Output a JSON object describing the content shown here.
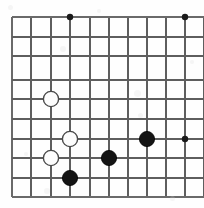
{
  "figure": {
    "kind": "go-board-diagram",
    "width_px": 204,
    "height_px": 208,
    "background_color": "#fefefe"
  },
  "board": {
    "line_color": "#5e5e5e",
    "edge_line_color": "#6a6a6a",
    "grid_spacing_px": 19.4,
    "vertical_lines_x": [
      12,
      31,
      51,
      70,
      90,
      109,
      128,
      147,
      166,
      185,
      204
    ],
    "horizontal_lines_y": [
      17,
      37,
      56,
      80,
      99,
      119,
      139,
      158,
      178,
      197
    ],
    "column_labels": [
      "a",
      "b",
      "c",
      "d",
      "e",
      "f",
      "g",
      "h",
      "i",
      "j",
      "k"
    ],
    "row_labels": [
      "1",
      "2",
      "3",
      "4",
      "5",
      "6",
      "7",
      "8",
      "9",
      "10"
    ],
    "cropped_edges": [
      "right",
      "bottom"
    ]
  },
  "star_points": {
    "color": "#1a1a1a",
    "radius_px": 3.2,
    "points": [
      {
        "id": "star-d1",
        "x": 70,
        "y": 17
      },
      {
        "id": "star-k1",
        "x": 185,
        "y": 17
      },
      {
        "id": "star-k7",
        "x": 185,
        "y": 139
      }
    ]
  },
  "stones": {
    "radius_px": 7.6,
    "black_fill": "#141414",
    "white_fill": "#fdfdfd",
    "white_stroke": "#4a4a4a",
    "items": [
      {
        "id": "white-stone-1",
        "color": "white",
        "x": 51,
        "y": 99,
        "label": "White stone at c5"
      },
      {
        "id": "white-stone-2",
        "color": "white",
        "x": 70,
        "y": 139,
        "label": "White stone at d7"
      },
      {
        "id": "white-stone-3",
        "color": "white",
        "x": 51,
        "y": 158,
        "label": "White stone at c8"
      },
      {
        "id": "black-stone-1",
        "color": "black",
        "x": 70,
        "y": 178,
        "label": "Black stone at d9"
      },
      {
        "id": "black-stone-2",
        "color": "black",
        "x": 109,
        "y": 158,
        "label": "Black stone at f8"
      },
      {
        "id": "black-stone-3",
        "color": "black",
        "x": 147,
        "y": 139,
        "label": "Black stone at h7"
      }
    ]
  },
  "specks": [
    {
      "x": 8,
      "y": 5,
      "size": 5
    },
    {
      "x": 97,
      "y": 9,
      "size": 4
    },
    {
      "x": 60,
      "y": 46,
      "size": 6
    },
    {
      "x": 134,
      "y": 90,
      "size": 7
    },
    {
      "x": 138,
      "y": 113,
      "size": 5
    },
    {
      "x": 24,
      "y": 152,
      "size": 4
    },
    {
      "x": 44,
      "y": 188,
      "size": 6
    },
    {
      "x": 170,
      "y": 196,
      "size": 5
    },
    {
      "x": 190,
      "y": 60,
      "size": 4
    }
  ]
}
